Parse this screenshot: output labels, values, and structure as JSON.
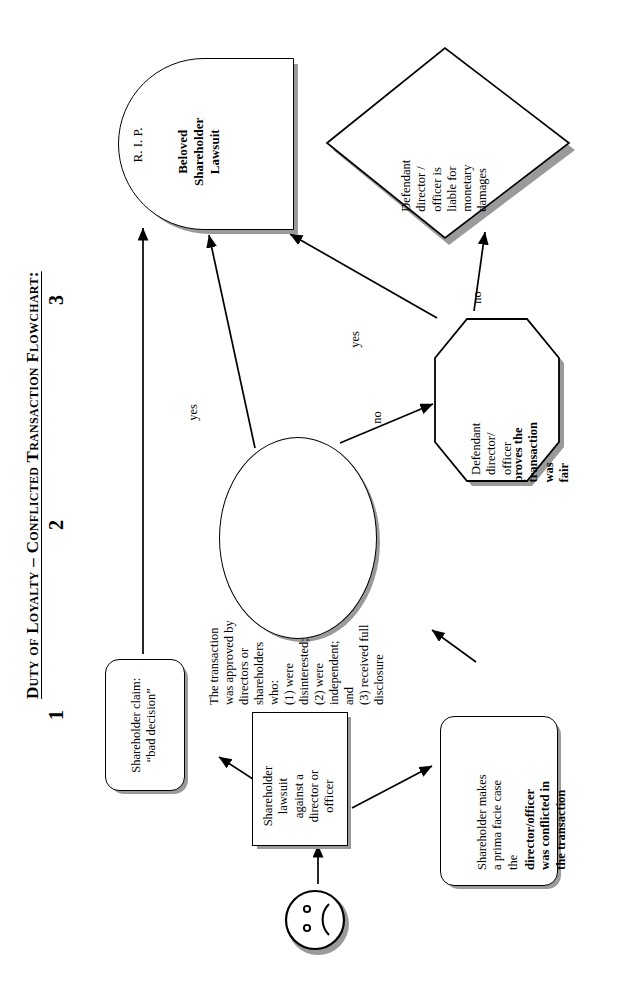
{
  "document": {
    "title": "Duty of Loyalty – Conflicted Transaction Flowchart:",
    "orientation": "rotated-90-ccw",
    "page_background": "#ffffff",
    "ink_color": "#000000",
    "shadow_color": "#9a9a9a"
  },
  "column_markers": [
    {
      "label": "1"
    },
    {
      "label": "2"
    },
    {
      "label": "3"
    }
  ],
  "nodes": {
    "sad_face": {
      "name": "sad-face",
      "shape": "circle-emoji",
      "label": ""
    },
    "lawsuit": {
      "shape": "rectangle",
      "text": "Shareholder\nlawsuit\nagainst a\ndirector or\nofficer"
    },
    "bad_decision": {
      "shape": "rounded-rectangle",
      "text": "Shareholder claim:\n“bad decision”"
    },
    "prima_facie": {
      "shape": "rounded-rectangle",
      "text_plain": "Shareholder makes\na prima facie case\nthe",
      "text_bold": "director/officer\nwas conflicted in\nthe transaction"
    },
    "approved": {
      "shape": "ellipse",
      "text": "The transaction\nwas approved by\ndirectors or\nshareholders\nwho:\n(1) were\ndisinterested;\n(2) were\nindependent;\nand\n(3) received full\ndisclosure"
    },
    "fairness": {
      "shape": "hexagon",
      "text_plain": "Defendant\ndirector/\nofficer",
      "text_bold": "proves the\ntransaction\nwas\nfair"
    },
    "liable": {
      "shape": "diamond",
      "text": "Defendant\ndirector /\nofficer is\nliable for\nmonetary\ndamages"
    },
    "rip": {
      "shape": "tombstone",
      "text_plain": "R. I. P.",
      "text_bold": "Beloved\nShareholder\nLawsuit"
    }
  },
  "edges": [
    {
      "from": "sad_face",
      "to": "lawsuit",
      "label": ""
    },
    {
      "from": "lawsuit",
      "to": "bad_decision",
      "label": ""
    },
    {
      "from": "lawsuit",
      "to": "prima_facie",
      "label": ""
    },
    {
      "from": "prima_facie",
      "to": "approved",
      "label": ""
    },
    {
      "from": "bad_decision",
      "to": "rip",
      "label": ""
    },
    {
      "from": "approved",
      "to": "rip",
      "label": "yes"
    },
    {
      "from": "approved",
      "to": "fairness",
      "label": "no"
    },
    {
      "from": "fairness",
      "to": "rip",
      "label": "yes"
    },
    {
      "from": "fairness",
      "to": "liable",
      "label": "no"
    }
  ],
  "edge_labels": {
    "approved_to_rip": "yes",
    "approved_to_fairness": "no",
    "fairness_to_rip": "yes",
    "fairness_to_liable": "no",
    "bad_decision_to_rip": "yes"
  }
}
